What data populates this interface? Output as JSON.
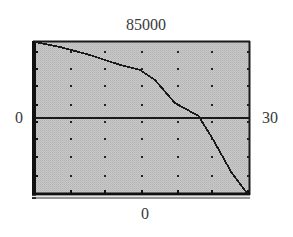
{
  "chart_data": {
    "type": "line",
    "title": "",
    "xlabel": "",
    "ylabel": "",
    "window": {
      "xmin": 0,
      "xmax": 30,
      "ymin": 0,
      "ymax": 85000
    },
    "window_labels": {
      "top": "85000",
      "bottom": "0",
      "left": "0",
      "right": "30"
    },
    "xlim": [
      0,
      30
    ],
    "ylim": [
      0,
      85000
    ],
    "grid": "dots",
    "legend": "none",
    "series": [
      {
        "name": "curve",
        "x": [
          0,
          3.5,
          7.7,
          11.9,
          14.7,
          16.8,
          19.6,
          22.9,
          25.0,
          27.5,
          29.7
        ],
        "values": [
          85000,
          82200,
          77700,
          72100,
          69300,
          63700,
          50700,
          43400,
          29900,
          11800,
          0
        ]
      },
      {
        "name": "horizontal-line",
        "x": [
          0,
          30
        ],
        "values": [
          42500,
          42500
        ]
      }
    ]
  },
  "colors": {
    "screen_background": "#c4c4c4",
    "ink": "#1a1a1a",
    "label_text": "#3a3a3a",
    "page_background": "#ffffff"
  },
  "screen_geometry": {
    "left": 35,
    "right": 249,
    "top": 42,
    "bottom": 193,
    "dot_columns_px": [
      71,
      105,
      142,
      178,
      212,
      248
    ],
    "dot_rows_px": [
      52,
      69,
      86,
      105,
      122,
      139,
      157,
      176,
      192
    ]
  }
}
